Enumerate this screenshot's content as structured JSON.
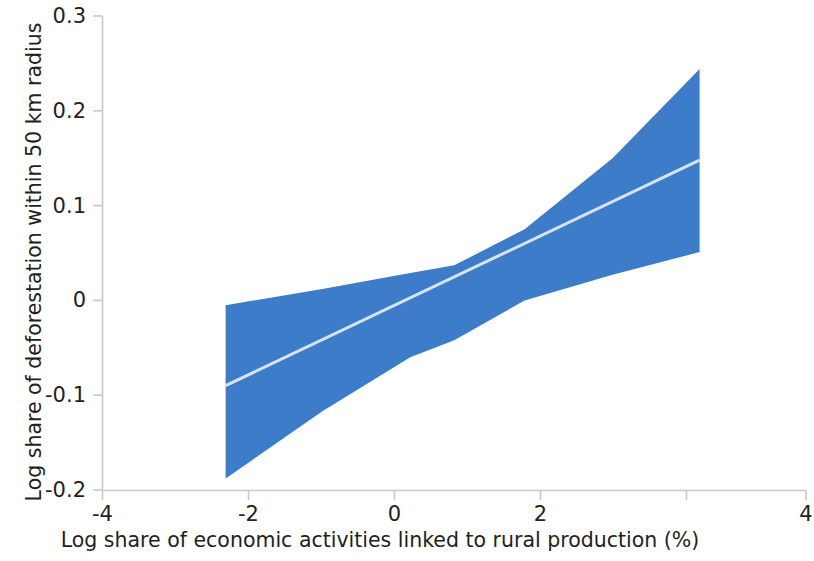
{
  "chart_data": {
    "type": "line",
    "title": "",
    "subtitle": "",
    "xlabel": "Log share of economic activities linked to rural production (%)",
    "ylabel": "Log share of deforestation within 50 km radius",
    "xlim": [
      -4,
      4
    ],
    "ylim": [
      -0.2,
      0.3
    ],
    "xticks": [
      -4,
      -2,
      0,
      2,
      4
    ],
    "xtick_labels": [
      "-4",
      "-2",
      "0",
      "2",
      "4"
    ],
    "yticks": [
      -0.2,
      -0.1,
      0,
      0.1,
      0.2,
      0.3
    ],
    "ytick_labels": [
      "-0.2",
      "-0.1",
      "0",
      "0.1",
      "0.2",
      "0.3"
    ],
    "grid": false,
    "legend": "none",
    "series": [
      {
        "name": "Fitted linear prediction",
        "type": "line",
        "color": "#d8e3f2",
        "x": [
          -2.6,
          2.79
        ],
        "values": [
          -0.09,
          0.148
        ]
      },
      {
        "name": "95% confidence interval",
        "type": "band",
        "color": "#3d7cc8",
        "x": [
          -2.6,
          -1.5,
          -0.5,
          0,
          0.8,
          1.8,
          2.79
        ],
        "upper": [
          -0.005,
          0.012,
          0.029,
          0.037,
          0.075,
          0.15,
          0.244
        ],
        "lower": [
          -0.188,
          -0.117,
          -0.06,
          -0.042,
          0.0,
          0.027,
          0.051
        ]
      }
    ],
    "fit_slope": 0.0441,
    "fit_intercept": 0.0245,
    "annotations": []
  },
  "axes": {
    "x_axis_color": "#c8c8c8",
    "y_axis_color": "#c8c8c8",
    "tick_color": "#c8c8c8"
  },
  "colors": {
    "band_blue": "#3d7cc8",
    "fit_line": "#d8e3f2",
    "text": "#231f20",
    "background": "#ffffff"
  }
}
